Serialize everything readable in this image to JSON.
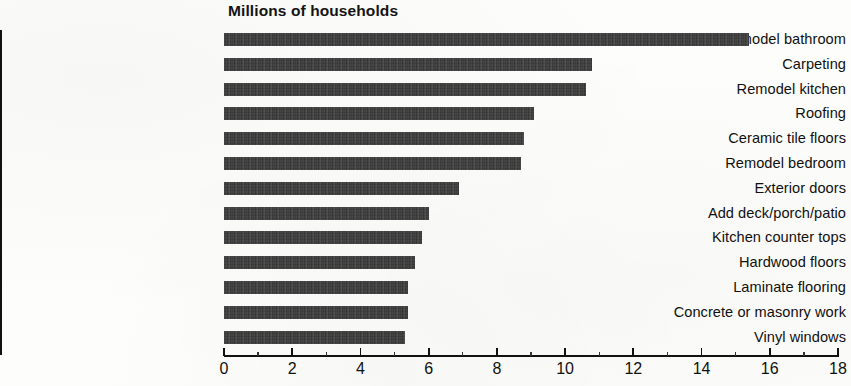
{
  "chart_data": {
    "type": "bar",
    "orientation": "horizontal",
    "title": "Millions of households",
    "xlabel": "",
    "ylabel": "",
    "xlim": [
      0,
      18
    ],
    "xticks": [
      0,
      2,
      4,
      6,
      8,
      10,
      12,
      14,
      16,
      18
    ],
    "xtick_labels": [
      "0",
      "2",
      "4",
      "6",
      "8",
      "10",
      "12",
      "14",
      "16",
      "18"
    ],
    "grid": false,
    "legend": null,
    "bar_color": "#2b2b2b",
    "categories": [
      "Remodel bathroom",
      "Carpeting",
      "Remodel kitchen",
      "Roofing",
      "Ceramic tile floors",
      "Remodel bedroom",
      "Exterior doors",
      "Add deck/porch/patio",
      "Kitchen counter tops",
      "Hardwood floors",
      "Laminate flooring",
      "Concrete or masonry work",
      "Vinyl windows"
    ],
    "values": [
      15.4,
      10.8,
      10.6,
      9.1,
      8.8,
      8.7,
      6.9,
      6.0,
      5.8,
      5.6,
      5.4,
      5.4,
      5.3
    ]
  }
}
